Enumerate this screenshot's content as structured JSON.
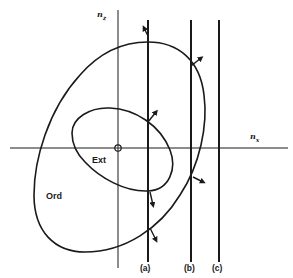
{
  "figure": {
    "axes": {
      "x_label": "n",
      "x_sub": "x",
      "z_label": "n",
      "z_sub": "z"
    },
    "regions": {
      "outer_surface": "Ord",
      "inner_surface": "Ext"
    },
    "boundary_lines": [
      {
        "id": "a",
        "label": "(a)"
      },
      {
        "id": "b",
        "label": "(b)"
      },
      {
        "id": "c",
        "label": "(c)"
      }
    ],
    "origin_marker": "⊕",
    "colors": {
      "ink": "#1a1a1a",
      "background": "#ffffff"
    }
  }
}
